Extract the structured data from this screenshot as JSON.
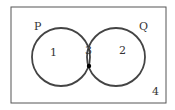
{
  "diagram": {
    "type": "venn",
    "sets": [
      {
        "name": "P",
        "label": "P"
      },
      {
        "name": "Q",
        "label": "Q"
      }
    ],
    "regions": [
      {
        "id": "only-p",
        "label": "1"
      },
      {
        "id": "p-and-q",
        "label": "3"
      },
      {
        "id": "only-q",
        "label": "2"
      },
      {
        "id": "outside",
        "label": "4"
      }
    ],
    "marker": {
      "region": "p-and-q",
      "shape": "dot"
    },
    "colors": {
      "stroke": "#444444",
      "text": "#333333",
      "dot": "#000000"
    }
  }
}
